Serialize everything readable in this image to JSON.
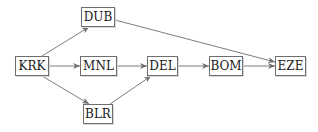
{
  "diagram": {
    "type": "directed-graph",
    "nodes": [
      {
        "id": "KRK",
        "label": "KRK"
      },
      {
        "id": "DUB",
        "label": "DUB"
      },
      {
        "id": "MNL",
        "label": "MNL"
      },
      {
        "id": "BLR",
        "label": "BLR"
      },
      {
        "id": "DEL",
        "label": "DEL"
      },
      {
        "id": "BOM",
        "label": "BOM"
      },
      {
        "id": "EZE",
        "label": "EZE"
      }
    ],
    "edges": [
      {
        "from": "KRK",
        "to": "DUB"
      },
      {
        "from": "KRK",
        "to": "MNL"
      },
      {
        "from": "KRK",
        "to": "BLR"
      },
      {
        "from": "MNL",
        "to": "DEL"
      },
      {
        "from": "BLR",
        "to": "DEL"
      },
      {
        "from": "DEL",
        "to": "BOM"
      },
      {
        "from": "BOM",
        "to": "EZE"
      },
      {
        "from": "DUB",
        "to": "EZE"
      }
    ],
    "colors": {
      "edge": "#6e6e6e",
      "node_border": "#6e6e6e",
      "text": "#1a1a1a"
    }
  }
}
